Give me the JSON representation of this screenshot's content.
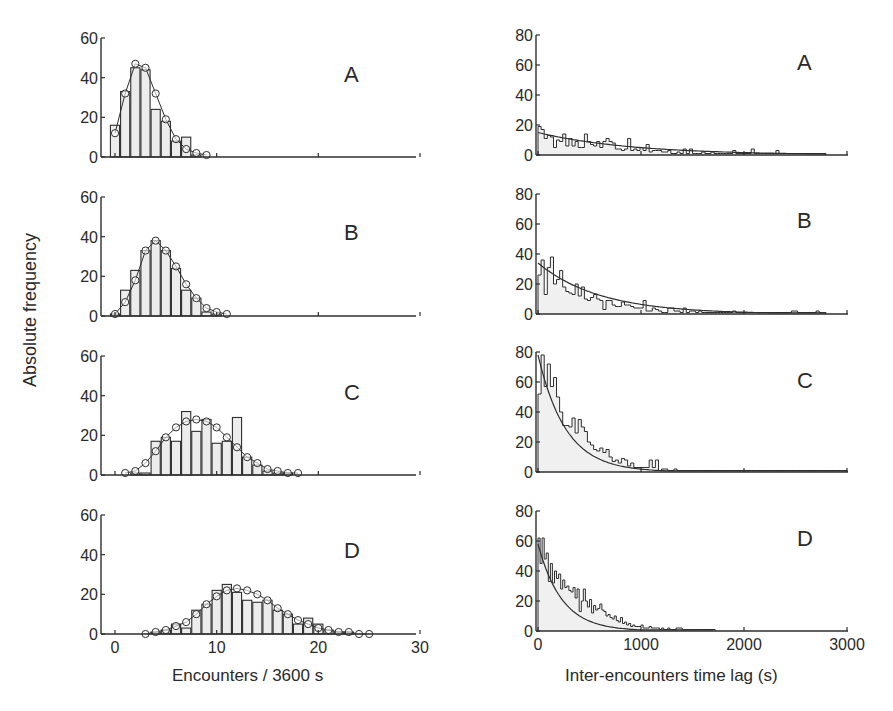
{
  "figure": {
    "ylabel": "Absolute frequency",
    "left_xlabel": "Encounters / 3600 s",
    "right_xlabel": "Inter-encounters time lag (s)"
  },
  "chart_data": [
    {
      "id": "left-A",
      "panel": "A",
      "type": "bar",
      "title": "",
      "xlabel": "Encounters / 3600 s",
      "ylabel": "Absolute frequency",
      "xlim": [
        -1,
        30
      ],
      "ylim": [
        0,
        60
      ],
      "xticks": [
        0,
        10,
        20,
        30
      ],
      "yticks": [
        0,
        20,
        40,
        60
      ],
      "show_xticklabels": false,
      "series": [
        {
          "name": "observed",
          "kind": "bar",
          "x": [
            0,
            1,
            2,
            3,
            4,
            5,
            6,
            7,
            8
          ],
          "values": [
            16,
            33,
            45,
            44,
            24,
            18,
            8,
            10,
            1
          ]
        },
        {
          "name": "model",
          "kind": "line-circles",
          "x": [
            0,
            1,
            2,
            3,
            4,
            5,
            6,
            7,
            8,
            9
          ],
          "values": [
            12,
            32,
            47,
            45,
            32,
            19,
            9,
            4,
            2,
            1
          ]
        }
      ]
    },
    {
      "id": "left-B",
      "panel": "B",
      "type": "bar",
      "xlim": [
        -1,
        30
      ],
      "ylim": [
        0,
        60
      ],
      "xticks": [
        0,
        10,
        20,
        30
      ],
      "yticks": [
        0,
        20,
        40,
        60
      ],
      "show_xticklabels": false,
      "series": [
        {
          "name": "observed",
          "kind": "bar",
          "x": [
            0,
            1,
            2,
            3,
            4,
            5,
            6,
            7,
            8,
            9,
            10
          ],
          "values": [
            1,
            13,
            23,
            33,
            38,
            33,
            24,
            13,
            9,
            2,
            1
          ]
        },
        {
          "name": "model",
          "kind": "line-circles",
          "x": [
            0,
            1,
            2,
            3,
            4,
            5,
            6,
            7,
            8,
            9,
            10,
            11
          ],
          "values": [
            1,
            7,
            18,
            33,
            38,
            33,
            25,
            16,
            9,
            4,
            2,
            1
          ]
        }
      ]
    },
    {
      "id": "left-C",
      "panel": "C",
      "type": "bar",
      "xlim": [
        -1,
        30
      ],
      "ylim": [
        0,
        60
      ],
      "xticks": [
        0,
        10,
        20,
        30
      ],
      "yticks": [
        0,
        20,
        40,
        60
      ],
      "show_xticklabels": false,
      "series": [
        {
          "name": "observed",
          "kind": "bar",
          "x": [
            1,
            2,
            3,
            4,
            5,
            6,
            7,
            8,
            9,
            10,
            11,
            12,
            13,
            14,
            15,
            16,
            17,
            18
          ],
          "values": [
            0,
            1,
            1,
            17,
            19,
            17,
            32,
            22,
            28,
            16,
            17,
            29,
            9,
            5,
            2,
            1,
            1,
            0
          ]
        },
        {
          "name": "model",
          "kind": "line-circles",
          "x": [
            1,
            2,
            3,
            4,
            5,
            6,
            7,
            8,
            9,
            10,
            11,
            12,
            13,
            14,
            15,
            16,
            17,
            18
          ],
          "values": [
            1,
            2,
            6,
            12,
            19,
            24,
            27,
            28,
            27,
            24,
            19,
            14,
            9,
            6,
            3,
            2,
            1,
            1
          ]
        }
      ]
    },
    {
      "id": "left-D",
      "panel": "D",
      "type": "bar",
      "xlim": [
        -1,
        30
      ],
      "ylim": [
        0,
        60
      ],
      "xticks": [
        0,
        10,
        20,
        30
      ],
      "yticks": [
        0,
        20,
        40,
        60
      ],
      "show_xticklabels": true,
      "series": [
        {
          "name": "observed",
          "kind": "bar",
          "x": [
            4,
            5,
            6,
            7,
            8,
            9,
            10,
            11,
            12,
            13,
            14,
            15,
            16,
            17,
            18,
            19,
            20,
            21,
            22,
            23
          ],
          "values": [
            1,
            2,
            5,
            3,
            12,
            15,
            22,
            25,
            21,
            17,
            16,
            17,
            12,
            10,
            5,
            8,
            5,
            2,
            1,
            1
          ]
        },
        {
          "name": "model",
          "kind": "line-circles",
          "x": [
            3,
            4,
            5,
            6,
            7,
            8,
            9,
            10,
            11,
            12,
            13,
            14,
            15,
            16,
            17,
            18,
            19,
            20,
            21,
            22,
            23,
            24,
            25
          ],
          "values": [
            0,
            1,
            2,
            4,
            6,
            10,
            15,
            19,
            22,
            23,
            22,
            20,
            17,
            13,
            10,
            7,
            5,
            3,
            2,
            1,
            1,
            0,
            0
          ]
        }
      ]
    },
    {
      "id": "right-A",
      "panel": "A",
      "type": "bar",
      "title": "",
      "xlabel": "Inter-encounters time lag (s)",
      "ylabel": "Absolute frequency",
      "xlim": [
        0,
        3000
      ],
      "ylim": [
        0,
        80
      ],
      "xticks": [
        0,
        1000,
        2000,
        3000
      ],
      "yticks": [
        0,
        20,
        40,
        60,
        80
      ],
      "show_xticklabels": false,
      "bin_width": 30,
      "fit": {
        "kind": "exponential",
        "a": 15,
        "tau": 900,
        "xmax": 2800
      },
      "series": [
        {
          "name": "observed",
          "kind": "step",
          "values": [
            19,
            17,
            11,
            13,
            12,
            5,
            10,
            9,
            14,
            6,
            11,
            6,
            9,
            5,
            5,
            14,
            9,
            7,
            6,
            9,
            5,
            9,
            11,
            9,
            8,
            4,
            4,
            3,
            4,
            11,
            3,
            4,
            3,
            5,
            3,
            7,
            2,
            3,
            3,
            3,
            2,
            2,
            3,
            1,
            1,
            2,
            1,
            4,
            1,
            4,
            1,
            1,
            1,
            2,
            1,
            1,
            2,
            1,
            1,
            1,
            1,
            1,
            1,
            3,
            1,
            1,
            1,
            1,
            1,
            4,
            1,
            1,
            1,
            1,
            1,
            1,
            1,
            3,
            1,
            1,
            1,
            1,
            1,
            1,
            1,
            1,
            1,
            1,
            1,
            1,
            1,
            1,
            1
          ]
        }
      ]
    },
    {
      "id": "right-B",
      "panel": "B",
      "type": "bar",
      "xlim": [
        0,
        3000
      ],
      "ylim": [
        0,
        80
      ],
      "xticks": [
        0,
        1000,
        2000,
        3000
      ],
      "yticks": [
        0,
        20,
        40,
        60,
        80
      ],
      "show_xticklabels": false,
      "bin_width": 30,
      "fit": {
        "kind": "exponential",
        "a": 34,
        "tau": 600,
        "xmax": 2800
      },
      "series": [
        {
          "name": "observed",
          "kind": "step",
          "values": [
            26,
            36,
            13,
            31,
            38,
            20,
            23,
            29,
            18,
            15,
            14,
            13,
            20,
            12,
            18,
            10,
            9,
            11,
            13,
            10,
            9,
            3,
            9,
            9,
            6,
            5,
            5,
            8,
            6,
            6,
            5,
            4,
            4,
            4,
            9,
            2,
            2,
            4,
            3,
            2,
            1,
            1,
            4,
            4,
            2,
            2,
            1,
            4,
            1,
            2,
            2,
            1,
            2,
            1,
            1,
            1,
            1,
            1,
            1,
            1,
            1,
            1,
            1,
            2,
            1,
            1,
            1,
            1,
            1,
            1,
            1,
            1,
            1,
            1,
            1,
            1,
            1,
            1,
            1,
            1,
            1,
            1,
            2,
            2,
            1,
            1,
            1,
            1,
            1,
            1,
            2,
            1,
            1
          ]
        }
      ]
    },
    {
      "id": "right-C",
      "panel": "C",
      "type": "bar",
      "xlim": [
        0,
        3000
      ],
      "ylim": [
        0,
        80
      ],
      "xticks": [
        0,
        1000,
        2000,
        3000
      ],
      "yticks": [
        0,
        20,
        40,
        60,
        80
      ],
      "show_xticklabels": false,
      "bin_width": 30,
      "fit": {
        "kind": "exponential",
        "a": 78,
        "tau": 270,
        "xmax": 3000
      },
      "series": [
        {
          "name": "observed",
          "kind": "step",
          "values": [
            52,
            78,
            57,
            72,
            57,
            63,
            50,
            40,
            31,
            31,
            30,
            36,
            26,
            35,
            30,
            27,
            20,
            18,
            15,
            14,
            16,
            13,
            15,
            10,
            7,
            8,
            6,
            9,
            8,
            4,
            6,
            3,
            3,
            3,
            3,
            3,
            8,
            3,
            8,
            1,
            2,
            2,
            1,
            1,
            2,
            1,
            1,
            1,
            1,
            1,
            1,
            1,
            1,
            1,
            1,
            1,
            1,
            1,
            1,
            1,
            1,
            1,
            1,
            1,
            1,
            1,
            1,
            1,
            1,
            1,
            1,
            1,
            1,
            1,
            1,
            1,
            1,
            1,
            1,
            1,
            1,
            1,
            1,
            1,
            1,
            1,
            1,
            1,
            1,
            1,
            1,
            1,
            1,
            1,
            1,
            1,
            1,
            1,
            1,
            1
          ]
        }
      ]
    },
    {
      "id": "right-D",
      "panel": "D",
      "type": "bar",
      "xlim": [
        0,
        3000
      ],
      "ylim": [
        0,
        80
      ],
      "xticks": [
        0,
        1000,
        2000,
        3000
      ],
      "yticks": [
        0,
        20,
        40,
        60,
        80
      ],
      "show_xticklabels": true,
      "bin_width": 20,
      "fit": {
        "kind": "exponential",
        "a": 58,
        "tau": 230,
        "xmax": 1700
      },
      "series": [
        {
          "name": "observed",
          "kind": "step",
          "values": [
            62,
            45,
            62,
            48,
            52,
            33,
            45,
            32,
            40,
            35,
            38,
            28,
            34,
            29,
            30,
            27,
            26,
            29,
            22,
            28,
            13,
            20,
            28,
            20,
            16,
            21,
            12,
            17,
            14,
            15,
            18,
            14,
            13,
            10,
            11,
            9,
            8,
            10,
            7,
            6,
            9,
            5,
            6,
            4,
            5,
            3,
            4,
            3,
            3,
            3,
            4,
            2,
            2,
            2,
            3,
            2,
            2,
            2,
            2,
            1,
            2,
            1,
            1,
            2,
            1,
            1,
            1,
            2,
            2,
            2,
            1,
            1,
            1,
            1,
            1,
            1,
            1,
            1,
            1,
            1,
            1,
            1,
            1,
            1,
            1,
            1
          ]
        }
      ]
    }
  ]
}
